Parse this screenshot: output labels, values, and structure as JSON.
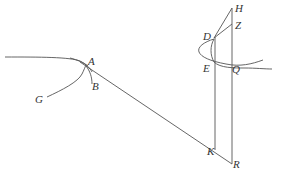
{
  "diagram": {
    "labels": {
      "A": "A",
      "B": "B",
      "G": "G",
      "H": "H",
      "Z": "Z",
      "D": "D",
      "E": "E",
      "Q": "Q",
      "K": "K",
      "R": "R"
    },
    "colors": {
      "stroke": "#555555",
      "text": "#333333",
      "background": "#ffffff"
    }
  }
}
